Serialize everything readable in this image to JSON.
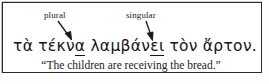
{
  "figure": {
    "type": "annotated-linguistic-example",
    "background_color": "#ffffff",
    "border_color": "#2b2b2b",
    "text_color": "#141414"
  },
  "annotations": [
    {
      "label": "plural",
      "target": "α",
      "target_word": "τέκνα"
    },
    {
      "label": "singular",
      "target": "ει",
      "target_word": "λαμβάνει"
    }
  ],
  "greek": {
    "full_text": "τὰ τέκνα λαμβάνει τὸν ἄρτον.",
    "words": [
      {
        "text": "τὰ",
        "stem": "τὰ",
        "ending": "",
        "underlined": false
      },
      {
        "text": "τέκνα",
        "stem": "τέκν",
        "ending": "α",
        "underlined": true
      },
      {
        "text": "λαμβάνει",
        "stem": "λαμβάν",
        "ending": "ει",
        "underlined": true
      },
      {
        "text": "τὸν",
        "stem": "τὸν",
        "ending": "",
        "underlined": false
      },
      {
        "text": "ἄρτον.",
        "stem": "ἄρτον.",
        "ending": "",
        "underlined": false
      }
    ]
  },
  "gloss": {
    "text": "“The children are receiving the bread.”"
  }
}
